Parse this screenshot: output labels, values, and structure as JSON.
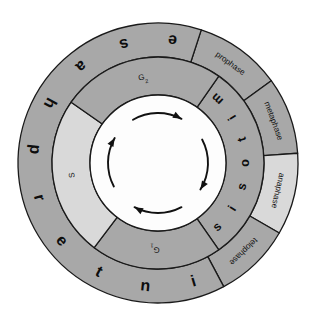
{
  "diagram": {
    "background_color": "#ffffff",
    "stroke_color": "#1a1a1a",
    "colors": {
      "ring_dark": "#a8a8a8",
      "ring_light": "#d9d9d9",
      "center_fill": "#fdfdfd",
      "outline": "#1a1a1a"
    },
    "center": {
      "cx": 158,
      "cy": 163
    },
    "radii": {
      "outer": 140,
      "middle": 106,
      "inner": 68
    },
    "outer_ring": {
      "name": "phase-names-ring",
      "segments": [
        {
          "id": "prophase",
          "label": "prophase",
          "fill": "ring_dark",
          "start_deg": -72,
          "end_deg": -36,
          "text_angle_deg": -54
        },
        {
          "id": "metaphase",
          "label": "metaphase",
          "fill": "ring_dark",
          "start_deg": -36,
          "end_deg": -4,
          "text_angle_deg": -20
        },
        {
          "id": "anaphase",
          "label": "anaphase",
          "fill": "ring_light",
          "start_deg": -4,
          "end_deg": 30,
          "text_angle_deg": 13
        },
        {
          "id": "telophase",
          "label": "telophase",
          "fill": "ring_dark",
          "start_deg": 30,
          "end_deg": 62,
          "text_angle_deg": 46
        },
        {
          "id": "interphase",
          "label": "interphase",
          "fill": "ring_dark",
          "start_deg": 62,
          "end_deg": 288,
          "letters": [
            "i",
            "n",
            "t",
            "e",
            "r",
            "p",
            "h",
            "a",
            "s",
            "e"
          ]
        }
      ]
    },
    "middle_ring": {
      "name": "cell-cycle-stage-ring",
      "segments": [
        {
          "id": "mitosis",
          "label": "mitosis",
          "fill": "ring_dark",
          "start_deg": -55,
          "end_deg": 55,
          "letters": [
            "m",
            "i",
            "t",
            "o",
            "s",
            "i",
            "s"
          ]
        },
        {
          "id": "g1",
          "label": "G",
          "subscript": "1",
          "fill": "ring_dark",
          "start_deg": 55,
          "end_deg": 127,
          "text_angle_deg": 92
        },
        {
          "id": "s",
          "label": "S",
          "fill": "ring_light",
          "start_deg": 127,
          "end_deg": 215,
          "text_angle_deg": 172
        },
        {
          "id": "g2",
          "label": "G",
          "subscript": "2",
          "fill": "ring_dark",
          "start_deg": 215,
          "end_deg": 305,
          "text_angle_deg": 260
        }
      ]
    },
    "center_arrows": {
      "name": "cycle-direction-arrows",
      "direction": "clockwise",
      "count": 4,
      "color": "#111111"
    }
  }
}
